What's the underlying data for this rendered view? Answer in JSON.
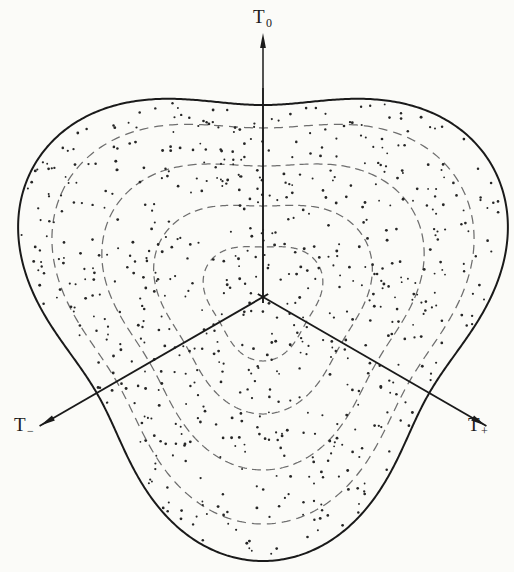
{
  "figure": {
    "kind": "dalitz-plot",
    "background_color": "#fbfbf8",
    "ink_color": "#1a1a1a",
    "contour_color": "#6e6e6e",
    "point_color": "#262626"
  },
  "axes": {
    "origin": {
      "x": 263,
      "y": 297
    },
    "items": [
      {
        "id": "T0",
        "label": "T",
        "sub": "0",
        "angle_deg": 90,
        "tip": {
          "x": 263,
          "y": 33
        },
        "label_pos": {
          "x": 253,
          "y": 6
        }
      },
      {
        "id": "Tminus",
        "label": "T",
        "sub": "−",
        "angle_deg": 210,
        "tip": {
          "x": 40,
          "y": 425
        },
        "label_pos": {
          "x": 14,
          "y": 414
        }
      },
      {
        "id": "Tplus",
        "label": "T",
        "sub": "+",
        "angle_deg": 330,
        "tip": {
          "x": 487,
          "y": 425
        },
        "label_pos": {
          "x": 468,
          "y": 414
        }
      }
    ]
  },
  "chart_data": {
    "type": "scatter",
    "title": "",
    "subtitle": "",
    "xlabel": "",
    "ylabel": "",
    "legend": [],
    "grid": false,
    "boundary": {
      "shape": "rounded-triangle",
      "orientation": "flat-top-vertex-down",
      "center": {
        "x": 263,
        "y": 297
      },
      "mean_radius": 228,
      "lobe_amplitude": 36,
      "corner_rounding": 0.22,
      "stroke_width": 2.0,
      "extents": {
        "top_y": 88,
        "bottom_y": 554,
        "left_x": 22,
        "right_x": 502
      }
    },
    "contour_rings": [
      {
        "index": 1,
        "mean_radius": 57,
        "lobe_amplitude": 7,
        "dash": "7 5"
      },
      {
        "index": 2,
        "mean_radius": 104,
        "lobe_amplitude": 13,
        "dash": "8 5"
      },
      {
        "index": 3,
        "mean_radius": 152,
        "lobe_amplitude": 21,
        "dash": "9 5"
      },
      {
        "index": 4,
        "mean_radius": 198,
        "lobe_amplitude": 29,
        "dash": "9 6"
      }
    ],
    "axis_rays": [
      {
        "id": "T0",
        "angle_deg": 90,
        "inner_end_radius": 209,
        "arrow_radius": 264
      },
      {
        "id": "Tminus",
        "angle_deg": 210,
        "inner_end_radius": 258,
        "arrow_radius": 257
      },
      {
        "id": "Tplus",
        "angle_deg": 330,
        "inner_end_radius": 258,
        "arrow_radius": 257
      }
    ],
    "points": {
      "count": 700,
      "marker": "dot",
      "marker_radius_px": 1.15,
      "distribution": "approximately uniform within the kinematic boundary",
      "x": "generated",
      "y": "generated"
    }
  }
}
